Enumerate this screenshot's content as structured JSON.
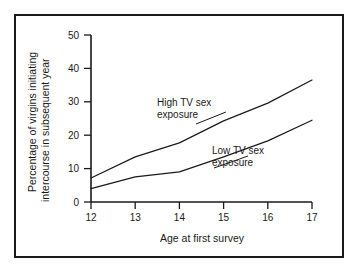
{
  "figure": {
    "frame_color": "#1a1a1a",
    "background_color": "#ffffff",
    "ink_color": "#1a1a1a"
  },
  "chart_data": {
    "type": "line",
    "title": "",
    "xlabel": "Age at first survey",
    "ylabel": "Percentage of virgins initiating intercourse in subsequent year",
    "ylabel_line1": "Percentage of virgins initiating",
    "ylabel_line2": "intercourse in subsequent year",
    "x": [
      12,
      13,
      14,
      15,
      16,
      17
    ],
    "categories": [
      "12",
      "13",
      "14",
      "15",
      "16",
      "17"
    ],
    "xtick_labels": [
      "12",
      "13",
      "14",
      "15",
      "16",
      "17"
    ],
    "ytick_labels": [
      "0",
      "10",
      "20",
      "30",
      "40",
      "50"
    ],
    "yticks": [
      0,
      10,
      20,
      30,
      40,
      50
    ],
    "xlim": [
      12,
      17
    ],
    "ylim": [
      0,
      50
    ],
    "grid": false,
    "legend_position": "inline-annotations",
    "series": [
      {
        "name": "High TV sex exposure",
        "label_line1": "High TV sex",
        "label_line2": "exposure",
        "values": [
          7.2,
          13.5,
          17.7,
          24.3,
          29.6,
          36.5
        ]
      },
      {
        "name": "Low TV sex exposure",
        "label_line1": "Low TV sex",
        "label_line2": "exposure",
        "values": [
          4.0,
          7.5,
          9.0,
          13.5,
          18.3,
          24.5
        ]
      }
    ],
    "annotations": [
      {
        "text": "High TV sex exposure",
        "x": 13.9,
        "y": 27.0
      },
      {
        "text": "Low TV sex exposure",
        "x": 15.2,
        "y": 12.4
      }
    ]
  }
}
